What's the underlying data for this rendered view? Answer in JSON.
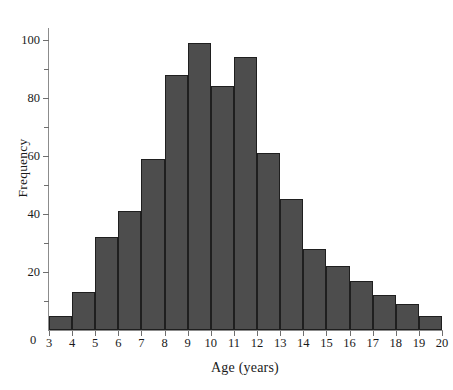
{
  "chart_data": {
    "type": "bar",
    "title": "",
    "subtitle": "",
    "xlabel": "Age (years)",
    "ylabel": "Frequency",
    "bin_edges": [
      3,
      4,
      5,
      6,
      7,
      8,
      9,
      10,
      11,
      12,
      13,
      14,
      15,
      16,
      17,
      18,
      19,
      20
    ],
    "categories": [
      "3-4",
      "4-5",
      "5-6",
      "6-7",
      "7-8",
      "8-9",
      "9-10",
      "10-11",
      "11-12",
      "12-13",
      "13-14",
      "14-15",
      "15-16",
      "16-17",
      "17-18",
      "18-19",
      "19-20"
    ],
    "values": [
      5,
      13,
      32,
      41,
      59,
      88,
      99,
      84,
      94,
      61,
      45,
      28,
      22,
      17,
      12,
      9,
      5
    ],
    "xlim": [
      3,
      20
    ],
    "ylim": [
      0,
      103
    ],
    "xticks": [
      3,
      4,
      5,
      6,
      7,
      8,
      9,
      10,
      11,
      12,
      13,
      14,
      15,
      16,
      17,
      18,
      19,
      20
    ],
    "xtick_labels": [
      "3",
      "4",
      "5",
      "6",
      "7",
      "8",
      "9",
      "10",
      "11",
      "12",
      "13",
      "14",
      "15",
      "16",
      "17",
      "18",
      "19",
      "20"
    ],
    "yticks_major": [
      0,
      20,
      40,
      60,
      80,
      100
    ],
    "ytick_labels": [
      "0",
      "20",
      "40",
      "60",
      "80",
      "100"
    ],
    "yticks_minor": [
      10,
      30,
      50,
      70,
      90
    ],
    "grid": false,
    "legend": null,
    "bar_color": "#4d4d4d",
    "bar_edge_color": "#1f1f1f",
    "axis_color": "#8c8c8c",
    "origin_label": "0"
  }
}
